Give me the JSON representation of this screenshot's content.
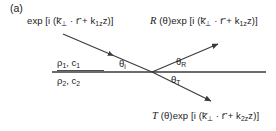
{
  "figure": {
    "panel_tag": "(a)",
    "background": "#ffffff",
    "line_color": "#3a3a3a"
  },
  "waves": {
    "incident": {
      "name": "incident-wave",
      "prefix": "exp [i (",
      "k_perp": "k",
      "k_perp_sub": "⊥",
      "dot": "·",
      "r": "r",
      "plus": " + ",
      "kz": "k",
      "kz_sub": "1z",
      "z": "z)]"
    },
    "reflected": {
      "name": "reflected-wave",
      "coefficient": "R",
      "theta_arg": "(θ)",
      "prefix": "exp [i (",
      "k_perp": "k",
      "k_perp_sub": "⊥",
      "dot": "·",
      "r": "r",
      "plus": " + ",
      "kz": "k",
      "kz_sub": "1z",
      "z": "z)]"
    },
    "transmitted": {
      "name": "transmitted-wave",
      "coefficient": "T",
      "theta_arg": "(θ)",
      "prefix": "exp [i (",
      "k_perp": "k",
      "k_perp_sub": "⊥",
      "dot": "·",
      "r": "r",
      "plus": " + ",
      "kz": "k",
      "kz_sub": "2z",
      "z": "z)]"
    }
  },
  "media": {
    "upper": {
      "density": "ρ",
      "density_sub": "1",
      "comma": ", ",
      "speed": "c",
      "speed_sub": "1"
    },
    "lower": {
      "density": "ρ",
      "density_sub": "2",
      "comma": ", ",
      "speed": "c",
      "speed_sub": "2"
    }
  },
  "angles": {
    "incident": {
      "symbol": "θ",
      "sub": "i"
    },
    "reflected": {
      "symbol": "θ",
      "sub": "R"
    },
    "transmitted": {
      "symbol": "θ",
      "sub": "T"
    }
  }
}
